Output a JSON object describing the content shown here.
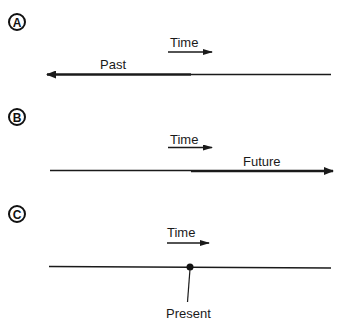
{
  "colors": {
    "ink": "#1a1a1a",
    "background": "#ffffff"
  },
  "panels": [
    {
      "id": "A",
      "badge": "A",
      "time_label": "Time",
      "segment_label": "Past",
      "direction": "left"
    },
    {
      "id": "B",
      "badge": "B",
      "time_label": "Time",
      "segment_label": "Future",
      "direction": "right"
    },
    {
      "id": "C",
      "badge": "C",
      "time_label": "Time",
      "point_label": "Present"
    }
  ]
}
